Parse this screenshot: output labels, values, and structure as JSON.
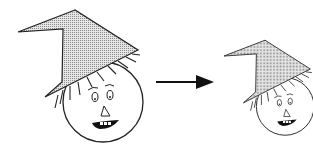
{
  "diagram": {
    "transformation": "scale",
    "scale_factor": 0.72,
    "figures": [
      {
        "name": "original-scarecrow",
        "role": "source"
      },
      {
        "name": "scaled-scarecrow",
        "role": "result"
      }
    ],
    "arrow": {
      "direction": "right"
    },
    "colors": {
      "stroke": "#222222",
      "hat_fill": "#c8c8c8",
      "face_fill": "#ffffff",
      "background": "#ffffff"
    }
  }
}
